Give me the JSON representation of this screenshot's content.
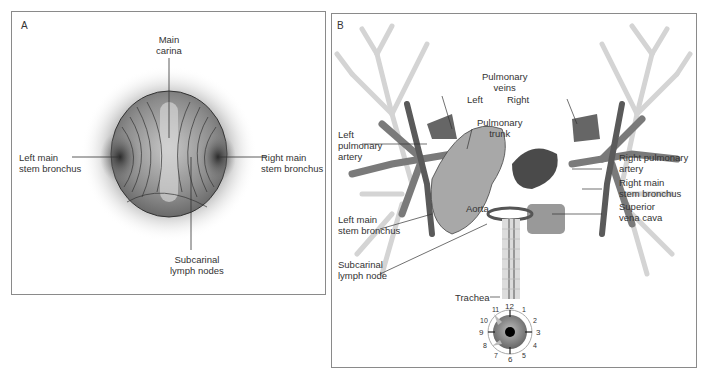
{
  "panel_a": {
    "letter": "A",
    "labels": {
      "main_carina": "Main\ncarina",
      "left_main_stem_bronchus": "Left main\nstem bronchus",
      "right_main_stem_bronchus": "Right main\nstem bronchus",
      "subcarinal_lymph_nodes": "Subcarinal\nlymph nodes"
    }
  },
  "panel_b": {
    "letter": "B",
    "labels": {
      "pulmonary_veins": "Pulmonary\nveins",
      "left": "Left",
      "right": "Right",
      "pulmonary_trunk": "Pulmonary\ntrunk",
      "left_pulmonary_artery": "Left\npulmonary\nartery",
      "right_pulmonary_artery": "Right pulmonary\nartery",
      "right_main_stem_bronchus": "Right main\nstem bronchus",
      "superior_vena_cava": "Superior\nvena cava",
      "aorta": "Aorta",
      "left_main_stem_bronchus": "Left main\nstem bronchus",
      "subcarinal_lymph_node": "Subcarinal\nlymph node",
      "trachea": "Trachea"
    },
    "clock_numbers": [
      "12",
      "1",
      "2",
      "3",
      "4",
      "5",
      "6",
      "7",
      "8",
      "9",
      "10",
      "11"
    ]
  },
  "colors": {
    "border": "#8a8a8a",
    "airway": "#d8d8d8",
    "vessel_dark": "#6e6e6e",
    "vessel_mid": "#9a9a9a",
    "text": "#333333"
  }
}
